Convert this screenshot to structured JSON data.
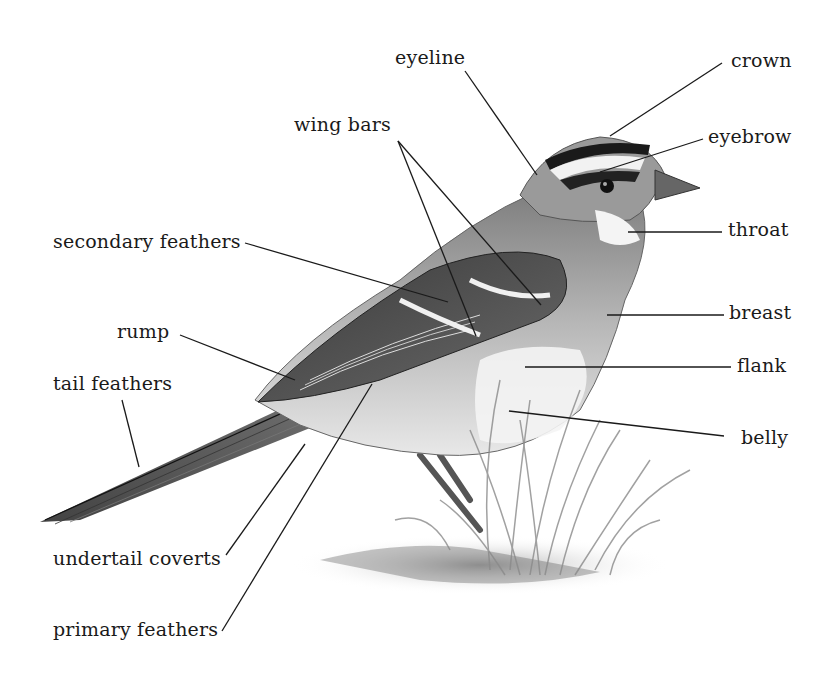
{
  "figure": {
    "background": "#ffffff",
    "ink_color": "#1a1a1a"
  },
  "labels": {
    "eyeline": "eyeline",
    "crown": "crown",
    "wing_bars": "wing bars",
    "eyebrow": "eyebrow",
    "secondary_feathers": "secondary feathers",
    "throat": "throat",
    "breast": "breast",
    "rump": "rump",
    "flank": "flank",
    "tail_feathers": "tail feathers",
    "belly": "belly",
    "undertail_coverts": "undertail coverts",
    "primary_feathers": "primary feathers"
  }
}
